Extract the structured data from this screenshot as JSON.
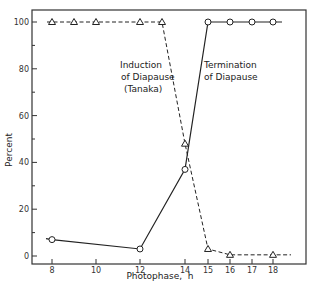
{
  "chart_data": {
    "type": "line",
    "title": "",
    "xlabel": "Photophase,  h",
    "ylabel": "Percent",
    "xlim": [
      7.3,
      19.5
    ],
    "ylim": [
      -4,
      105
    ],
    "x_ticks": [
      8,
      10,
      12,
      14,
      15,
      16,
      17,
      18
    ],
    "y_ticks": [
      0,
      20,
      40,
      60,
      80,
      100
    ],
    "grid": false,
    "legend": null,
    "series": [
      {
        "name": "Induction of Diapause (Tanaka)",
        "marker": "triangle",
        "line_style": "dashed",
        "x": [
          8,
          9,
          10,
          12,
          13,
          14,
          15,
          16,
          18
        ],
        "y": [
          100,
          100,
          100,
          100,
          100,
          48,
          3,
          0.5,
          0.5
        ]
      },
      {
        "name": "Termination of Diapause",
        "marker": "circle",
        "line_style": "solid",
        "x": [
          8,
          12,
          14,
          15,
          16,
          17,
          18
        ],
        "y": [
          7,
          3,
          37,
          100,
          100,
          100,
          100
        ]
      }
    ],
    "annotations": [
      {
        "lines": [
          "Induction",
          "of Diapause",
          "(Tanaka)"
        ],
        "near_series": "Induction of Diapause (Tanaka)"
      },
      {
        "lines": [
          "Termination",
          "of Diapause"
        ],
        "near_series": "Termination of Diapause"
      }
    ]
  },
  "labels": {
    "xlabel": "Photophase,  h",
    "ylabel": "Percent",
    "induction": [
      "Induction",
      "of Diapause",
      "(Tanaka)"
    ],
    "termination": [
      "Termination",
      "of Diapause"
    ]
  }
}
